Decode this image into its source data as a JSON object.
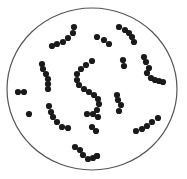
{
  "diagram": {
    "type": "microscope-field",
    "background": "#ffffff",
    "field": {
      "cx": 92,
      "cy": 89,
      "rx": 85,
      "ry": 81,
      "stroke": "#555555",
      "stroke_width": 1.2
    },
    "dot_color": "#1a1a1a",
    "dot_radius": 3.1,
    "chains": [
      {
        "name": "top-left-chain",
        "points": [
          [
            52,
            46
          ],
          [
            57,
            44
          ],
          [
            63,
            42
          ],
          [
            68,
            38
          ],
          [
            73,
            33
          ],
          [
            74,
            27
          ]
        ]
      },
      {
        "name": "top-center-chain",
        "points": [
          [
            97,
            37
          ],
          [
            104,
            40
          ],
          [
            109,
            44
          ]
        ]
      },
      {
        "name": "top-right-chain",
        "points": [
          [
            119,
            27
          ],
          [
            125,
            30
          ],
          [
            129,
            33
          ],
          [
            132,
            37
          ],
          [
            134,
            42
          ]
        ]
      },
      {
        "name": "left-vertical-chain",
        "points": [
          [
            42,
            64
          ],
          [
            43,
            69
          ],
          [
            46,
            74
          ],
          [
            48,
            79
          ],
          [
            48,
            84
          ],
          [
            48,
            89
          ]
        ]
      },
      {
        "name": "left-pair",
        "points": [
          [
            18,
            92
          ],
          [
            24,
            92
          ]
        ]
      },
      {
        "name": "left-single",
        "points": [
          [
            29,
            114
          ]
        ]
      },
      {
        "name": "center-s-chain",
        "points": [
          [
            92,
            61
          ],
          [
            86,
            65
          ],
          [
            81,
            69
          ],
          [
            77,
            74
          ],
          [
            77,
            80
          ],
          [
            79,
            85
          ],
          [
            84,
            89
          ],
          [
            89,
            92
          ],
          [
            94,
            95
          ],
          [
            98,
            99
          ],
          [
            99,
            104
          ],
          [
            97,
            110
          ]
        ]
      },
      {
        "name": "center-pair-a",
        "points": [
          [
            87,
            114
          ],
          [
            93,
            114
          ]
        ]
      },
      {
        "name": "center-pair-b",
        "points": [
          [
            92,
            127
          ],
          [
            96,
            131
          ]
        ]
      },
      {
        "name": "mid-pair",
        "points": [
          [
            123,
            60
          ],
          [
            124,
            66
          ]
        ]
      },
      {
        "name": "right-center-chain",
        "points": [
          [
            117,
            95
          ],
          [
            118,
            100
          ],
          [
            121,
            105
          ],
          [
            119,
            111
          ]
        ]
      },
      {
        "name": "right-chain",
        "points": [
          [
            144,
            57
          ],
          [
            146,
            62
          ],
          [
            149,
            68
          ],
          [
            147,
            73
          ],
          [
            151,
            78
          ],
          [
            155,
            80
          ],
          [
            159,
            81
          ],
          [
            163,
            82
          ]
        ]
      },
      {
        "name": "lower-left-chain",
        "points": [
          [
            49,
            106
          ],
          [
            51,
            112
          ],
          [
            53,
            117
          ],
          [
            57,
            122
          ],
          [
            62,
            127
          ],
          [
            68,
            128
          ]
        ]
      },
      {
        "name": "lower-right-chain",
        "points": [
          [
            136,
            131
          ],
          [
            142,
            129
          ],
          [
            147,
            126
          ],
          [
            152,
            122
          ],
          [
            158,
            118
          ]
        ]
      },
      {
        "name": "bottom-chain",
        "points": [
          [
            75,
            147
          ],
          [
            80,
            150
          ],
          [
            83,
            155
          ],
          [
            88,
            159
          ],
          [
            93,
            158
          ],
          [
            97,
            156
          ]
        ]
      },
      {
        "name": "right-single",
        "points": [
          [
            97,
            156
          ]
        ]
      },
      {
        "name": "lower-single",
        "points": [
          [
            98,
            117
          ]
        ]
      }
    ]
  }
}
